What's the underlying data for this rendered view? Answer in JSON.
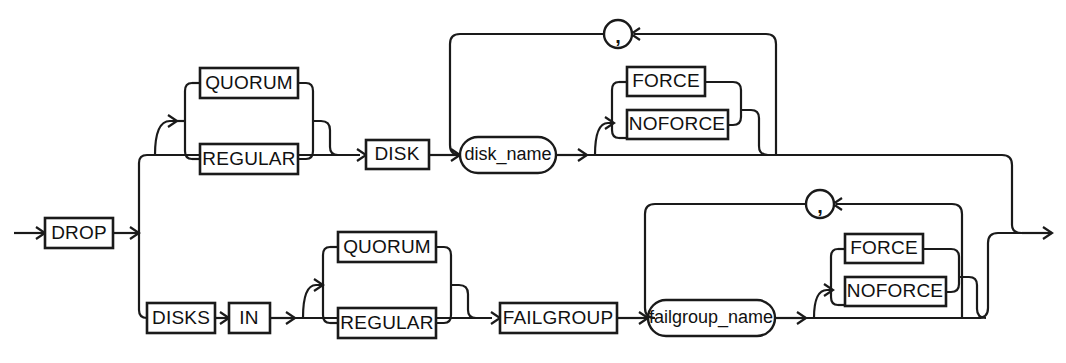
{
  "diagram": {
    "kind": "railroad-syntax-diagram",
    "entry_label": "",
    "exit_label": "",
    "colors": {
      "line": "#1a1a1a",
      "background": "#ffffff",
      "text": "#111111"
    },
    "nodes": {
      "drop": {
        "label": "DROP",
        "type": "keyword"
      },
      "quorum_top": {
        "label": "QUORUM",
        "type": "keyword"
      },
      "regular_top": {
        "label": "REGULAR",
        "type": "keyword"
      },
      "disk": {
        "label": "DISK",
        "type": "keyword"
      },
      "disk_name": {
        "label": "disk_name",
        "type": "variable"
      },
      "force_top": {
        "label": "FORCE",
        "type": "keyword"
      },
      "noforce_top": {
        "label": "NOFORCE",
        "type": "keyword"
      },
      "comma_top": {
        "label": ",",
        "type": "separator"
      },
      "disks": {
        "label": "DISKS",
        "type": "keyword"
      },
      "in": {
        "label": "IN",
        "type": "keyword"
      },
      "quorum_bottom": {
        "label": "QUORUM",
        "type": "keyword"
      },
      "regular_bottom": {
        "label": "REGULAR",
        "type": "keyword"
      },
      "failgroup": {
        "label": "FAILGROUP",
        "type": "keyword"
      },
      "failgroup_name": {
        "label": "failgroup_name",
        "type": "variable"
      },
      "force_bottom": {
        "label": "FORCE",
        "type": "keyword"
      },
      "noforce_bottom": {
        "label": "NOFORCE",
        "type": "keyword"
      },
      "comma_bottom": {
        "label": ",",
        "type": "separator"
      }
    }
  }
}
